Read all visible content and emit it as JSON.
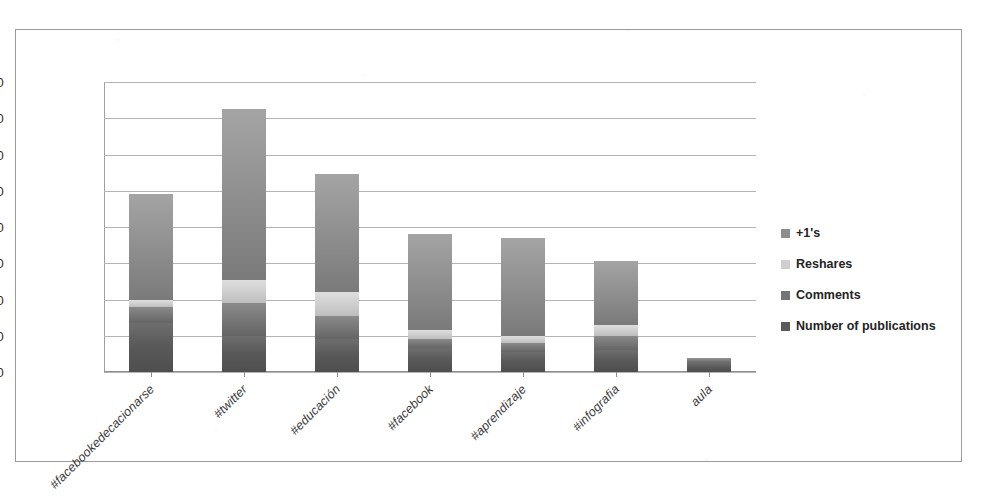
{
  "chart_data": {
    "type": "bar",
    "subtype": "stacked-column",
    "title": "",
    "subtitle": "",
    "xlabel": "",
    "ylabel": "",
    "ylim": [
      0,
      160
    ],
    "ytick_step": 20,
    "yticks": [
      "0",
      "20",
      "40",
      "60",
      "80",
      "100",
      "120",
      "140",
      "160"
    ],
    "grid": true,
    "legend_position": "right",
    "categories": [
      "#facebookedecacionarse",
      "#twitter",
      "#educación",
      "#facebook",
      "#aprendizaje",
      "#infografia",
      "aula"
    ],
    "series": [
      {
        "name": "Number of publications",
        "color": "#5a5a5a",
        "values": [
          27,
          20,
          18,
          13,
          11,
          12,
          5
        ]
      },
      {
        "name": "Comments",
        "color": "#747474",
        "values": [
          9,
          18,
          13,
          5,
          5,
          8,
          2
        ]
      },
      {
        "name": "Reshares",
        "color": "#cfcfcf",
        "values": [
          4,
          13,
          13,
          5,
          4,
          6,
          0
        ]
      },
      {
        "name": "+1's",
        "color": "#8d8d8d",
        "values": [
          58,
          94,
          65,
          53,
          54,
          35,
          1
        ]
      }
    ],
    "totals": [
      98,
      145,
      109,
      76,
      74,
      61,
      8
    ]
  },
  "legend": {
    "items": [
      {
        "label": "+1's",
        "swatch": "legend-swatch-plus-ones"
      },
      {
        "label": "Reshares",
        "swatch": "legend-swatch-reshares"
      },
      {
        "label": "Comments",
        "swatch": "legend-swatch-comments"
      },
      {
        "label": "Number of publications",
        "swatch": "legend-swatch-publications"
      }
    ]
  }
}
